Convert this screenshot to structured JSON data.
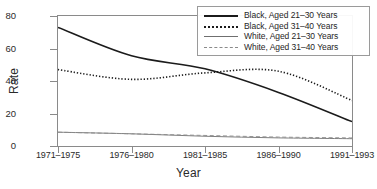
{
  "chart_data": {
    "type": "line",
    "title": "",
    "xlabel": "Year",
    "ylabel": "Rate",
    "categories": [
      "1971–1975",
      "1976–1980",
      "1981–1985",
      "1986–1990",
      "1991–1993"
    ],
    "ylim": [
      0,
      80
    ],
    "yticks": [
      0,
      20,
      40,
      60,
      80
    ],
    "grid": false,
    "legend_position": "top-right",
    "series": [
      {
        "name": "Black, Aged 21–30 Years",
        "style": "solid-thick",
        "color": "#1b1b1b",
        "values": [
          73,
          55.5,
          47.5,
          33,
          15
        ]
      },
      {
        "name": "Black, Aged 31–40 Years",
        "style": "dotted",
        "color": "#1b1b1b",
        "values": [
          47,
          41,
          45,
          46,
          28
        ]
      },
      {
        "name": "White, Aged 21–30 Years",
        "style": "solid-thin",
        "color": "#6f6f6f",
        "values": [
          8.5,
          7.5,
          6,
          5,
          4.5
        ]
      },
      {
        "name": "White, Aged 31–40 Years",
        "style": "dashed",
        "color": "#8a8a8a",
        "values": [
          8.5,
          7.5,
          6.5,
          5.5,
          5
        ]
      }
    ]
  },
  "axes": {
    "ylabel": "Rate",
    "xlabel": "Year",
    "ytick_labels": [
      "80",
      "60",
      "40",
      "20",
      "0"
    ],
    "xtick_labels": [
      "1971–1975",
      "1976–1980",
      "1981–1985",
      "1986–1990",
      "1991–1993"
    ]
  },
  "legend": {
    "items": [
      {
        "label": "Black, Aged 21–30 Years",
        "style": "solid-thick"
      },
      {
        "label": "Black, Aged 31–40 Years",
        "style": "dotted"
      },
      {
        "label": "White, Aged 21–30 Years",
        "style": "solid-thin"
      },
      {
        "label": "White, Aged 31–40 Years",
        "style": "dashed"
      }
    ]
  }
}
